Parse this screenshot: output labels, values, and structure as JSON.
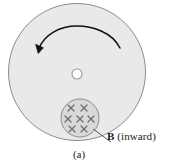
{
  "figure": {
    "type": "physics-diagram",
    "caption": "(a)",
    "background_color": "#ffffff",
    "disk": {
      "name": "rotating-conducting-disk",
      "center_x": 77,
      "center_y": 72,
      "radius": 69,
      "fill_color": "#e9e9e9",
      "stroke_color": "#8c8c8c"
    },
    "axle": {
      "name": "center-axle-hole",
      "center_x": 77,
      "center_y": 74,
      "radius": 5,
      "fill_color": "#ffffff",
      "stroke_color": "#9a9a9a"
    },
    "rotation_arrow": {
      "name": "counterclockwise-rotation-arrow",
      "direction": "counterclockwise",
      "stroke_color": "#111111"
    },
    "field_region": {
      "name": "magnetic-field-region",
      "center_x": 80,
      "center_y": 118,
      "radius": 19,
      "fill_color": "#d9d9d9",
      "stroke_color": "#8c8c8c",
      "marker_glyph": "x",
      "marker_color": "#6e6e6e",
      "marker_count": 7,
      "marker_rows": [
        [
          {
            "x": -9,
            "y": -10
          },
          {
            "x": 4,
            "y": -10
          }
        ],
        [
          {
            "x": -12,
            "y": 1
          },
          {
            "x": 0,
            "y": 1
          },
          {
            "x": 11,
            "y": 1
          }
        ],
        [
          {
            "x": -8,
            "y": 11
          },
          {
            "x": 4,
            "y": 11
          }
        ]
      ]
    },
    "leader_line": {
      "name": "field-label-leader-line",
      "from_x": 93,
      "from_y": 129,
      "to_x": 111,
      "to_y": 142,
      "stroke_color": "#555555"
    }
  },
  "labels": {
    "field_symbol": "B",
    "field_qualifier": "(inward)",
    "panel_caption": "(a)"
  }
}
